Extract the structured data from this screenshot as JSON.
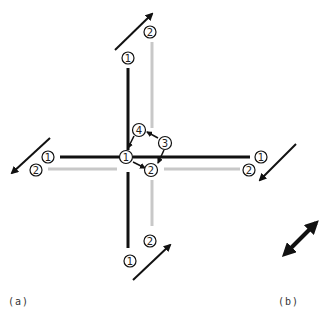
{
  "colors": {
    "primary_line": "#111111",
    "secondary_line": "#c8c8c8",
    "arrow": "#111111",
    "background": "#ffffff"
  },
  "panel_a": {
    "caption": "(a)",
    "labels": {
      "top_1": "1",
      "top_2": "2",
      "left_1": "1",
      "left_2": "2",
      "right_1": "1",
      "right_2": "2",
      "bottom_1": "1",
      "bottom_2": "2",
      "center_1": "1",
      "center_2": "2",
      "center_3": "3",
      "center_4": "4"
    }
  },
  "panel_b": {
    "caption": "(b)",
    "arrow": "double-headed-diagonal-arrow"
  }
}
